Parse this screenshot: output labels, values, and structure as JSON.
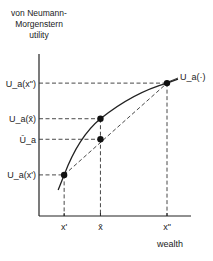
{
  "diagram": {
    "title_lines": [
      "von Neumann-",
      "Morgenstern",
      "utility"
    ],
    "xaxis_label": "wealth",
    "curve_label": "U_a(·)",
    "x_ticks": [
      {
        "id": "x1",
        "label": "x'",
        "wealth": 0.15
      },
      {
        "id": "xbar",
        "label": "x̄",
        "wealth": 0.45
      },
      {
        "id": "x2",
        "label": "x\"",
        "wealth": 1.0
      }
    ],
    "y_ticks": [
      {
        "id": "u_x2",
        "label": "U_a(x\")",
        "utility": 0.97
      },
      {
        "id": "u_xbar",
        "label": "U_a(x̄)",
        "utility": 0.71
      },
      {
        "id": "ubar",
        "label": "Ū_a",
        "utility": 0.56
      },
      {
        "id": "u_x1",
        "label": "U_a(x')",
        "utility": 0.3
      }
    ],
    "points": [
      {
        "name": "point-x1",
        "wealth": 0.15,
        "utility": 0.3
      },
      {
        "name": "point-xbar-curve",
        "wealth": 0.45,
        "utility": 0.71
      },
      {
        "name": "point-xbar-chord",
        "wealth": 0.45,
        "utility": 0.56
      },
      {
        "name": "point-x2",
        "wealth": 1.0,
        "utility": 0.97
      }
    ]
  }
}
